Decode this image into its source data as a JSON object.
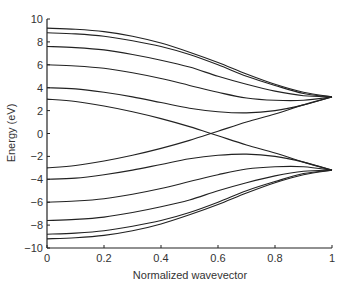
{
  "chart_data": {
    "type": "line",
    "title": "",
    "xlabel": "Normalized wavevector",
    "ylabel": "Energy (eV)",
    "xlim": [
      0,
      1
    ],
    "ylim": [
      -10,
      10
    ],
    "xticks": [
      0,
      0.2,
      0.4,
      0.6,
      0.8,
      1
    ],
    "xtick_labels": [
      "0",
      "0.2",
      "0.4",
      "0.6",
      "0.8",
      "1"
    ],
    "yticks": [
      -10,
      -8,
      -6,
      -4,
      -2,
      0,
      2,
      4,
      6,
      8,
      10
    ],
    "ytick_labels": [
      "−10",
      "−8",
      "−6",
      "−4",
      "−2",
      "0",
      "2",
      "4",
      "6",
      "8",
      "10"
    ],
    "grid": false,
    "legend": null,
    "x": [
      0,
      0.1,
      0.2,
      0.3,
      0.4,
      0.5,
      0.6,
      0.7,
      0.8,
      0.9,
      1.0
    ],
    "series": [
      {
        "name": "band+1",
        "values": [
          9.2,
          9.1,
          8.9,
          8.5,
          7.9,
          7.1,
          6.2,
          5.2,
          4.3,
          3.6,
          3.2
        ]
      },
      {
        "name": "band+2",
        "values": [
          8.8,
          8.7,
          8.5,
          8.1,
          7.6,
          6.9,
          6.0,
          5.0,
          4.2,
          3.5,
          3.2
        ]
      },
      {
        "name": "band+3",
        "values": [
          7.6,
          7.5,
          7.3,
          6.9,
          6.4,
          5.8,
          5.0,
          4.3,
          3.7,
          3.3,
          3.2
        ]
      },
      {
        "name": "band+4",
        "values": [
          6.0,
          5.9,
          5.7,
          5.3,
          4.8,
          4.2,
          3.6,
          3.1,
          2.9,
          2.9,
          3.2
        ]
      },
      {
        "name": "band+5",
        "values": [
          4.0,
          3.9,
          3.6,
          3.2,
          2.7,
          2.2,
          1.9,
          1.8,
          2.0,
          2.5,
          3.2
        ]
      },
      {
        "name": "band+6",
        "values": [
          3.0,
          2.8,
          2.4,
          1.9,
          1.3,
          0.6,
          -0.2,
          -1.0,
          -1.7,
          -2.5,
          -3.2
        ]
      },
      {
        "name": "band-6",
        "values": [
          -3.0,
          -2.8,
          -2.4,
          -1.9,
          -1.3,
          -0.6,
          0.2,
          1.0,
          1.7,
          2.5,
          3.2
        ]
      },
      {
        "name": "band-5",
        "values": [
          -4.0,
          -3.9,
          -3.6,
          -3.2,
          -2.7,
          -2.2,
          -1.9,
          -1.8,
          -2.0,
          -2.5,
          -3.2
        ]
      },
      {
        "name": "band-4",
        "values": [
          -6.0,
          -5.9,
          -5.7,
          -5.3,
          -4.8,
          -4.2,
          -3.6,
          -3.1,
          -2.9,
          -2.9,
          -3.2
        ]
      },
      {
        "name": "band-3",
        "values": [
          -7.6,
          -7.5,
          -7.3,
          -6.9,
          -6.4,
          -5.8,
          -5.0,
          -4.3,
          -3.7,
          -3.3,
          -3.2
        ]
      },
      {
        "name": "band-2",
        "values": [
          -8.8,
          -8.7,
          -8.5,
          -8.1,
          -7.6,
          -6.9,
          -6.0,
          -5.0,
          -4.2,
          -3.5,
          -3.2
        ]
      },
      {
        "name": "band-1",
        "values": [
          -9.2,
          -9.1,
          -8.9,
          -8.5,
          -7.9,
          -7.1,
          -6.2,
          -5.2,
          -4.3,
          -3.6,
          -3.2
        ]
      }
    ],
    "line_color": "#222222"
  }
}
